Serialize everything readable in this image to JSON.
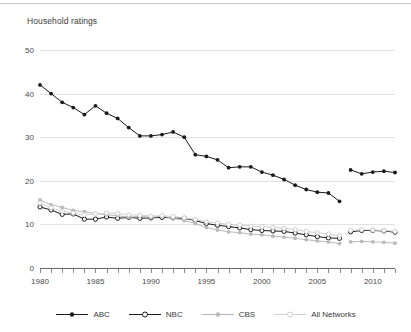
{
  "header": {
    "title": "Household ratings"
  },
  "chart_data": {
    "type": "line",
    "title": "Household ratings",
    "xlabel": "",
    "ylabel": "",
    "ylim": [
      0,
      50
    ],
    "xlim": [
      1980,
      2012
    ],
    "grid": true,
    "legend_position": "bottom",
    "y_ticks": [
      0,
      10,
      20,
      30,
      40,
      50
    ],
    "x_ticks": [
      1980,
      1985,
      1990,
      1995,
      2000,
      2005,
      2010
    ],
    "x_tick_labels": [
      "1980",
      "1985",
      "1990",
      "1995",
      "2000",
      "2005",
      "2010"
    ],
    "y_tick_labels": [
      "0",
      "10",
      "20",
      "30",
      "40",
      "50"
    ],
    "x": [
      1980,
      1981,
      1982,
      1983,
      1984,
      1985,
      1986,
      1987,
      1988,
      1989,
      1990,
      1991,
      1992,
      1993,
      1994,
      1995,
      1996,
      1997,
      1998,
      1999,
      2000,
      2001,
      2002,
      2003,
      2004,
      2005,
      2006,
      2007,
      2008,
      2009,
      2010,
      2011,
      2012
    ],
    "break_after_x": 2007,
    "series": [
      {
        "name": "ABC",
        "color": "#1a1a1a",
        "marker": "filled-circle",
        "values": [
          42.0,
          40.0,
          38.0,
          36.8,
          35.2,
          37.2,
          35.5,
          34.3,
          32.2,
          30.3,
          30.3,
          30.6,
          31.2,
          30.0,
          26.0,
          25.6,
          24.8,
          23.0,
          23.2,
          23.2,
          22.0,
          21.3,
          20.3,
          19.0,
          18.0,
          17.4,
          17.2,
          15.3,
          22.5,
          21.6,
          22.0,
          22.2,
          21.9
        ]
      },
      {
        "name": "NBC",
        "color": "#1a1a1a",
        "marker": "open-circle",
        "values": [
          14.0,
          13.3,
          12.3,
          12.4,
          11.2,
          11.2,
          11.7,
          11.4,
          11.6,
          11.4,
          11.5,
          11.6,
          11.5,
          11.4,
          10.9,
          10.2,
          9.8,
          9.5,
          9.2,
          8.8,
          8.6,
          8.5,
          8.4,
          8.0,
          7.6,
          7.2,
          6.9,
          6.8,
          8.3,
          8.6,
          8.6,
          8.5,
          8.2
        ]
      },
      {
        "name": "CBS",
        "color": "#b9b9b9",
        "marker": "filled-circle",
        "values": [
          15.6,
          14.5,
          13.9,
          13.2,
          12.9,
          12.5,
          12.2,
          12.0,
          11.6,
          11.9,
          11.6,
          11.9,
          11.4,
          10.9,
          10.2,
          9.3,
          8.7,
          8.3,
          8.1,
          7.8,
          7.6,
          7.3,
          7.1,
          6.8,
          6.5,
          6.2,
          6.0,
          5.6,
          6.0,
          6.1,
          6.0,
          5.9,
          5.7
        ]
      },
      {
        "name": "All Networks",
        "color": "#cfcfcf",
        "marker": "open-circle",
        "values": [
          14.9,
          13.8,
          13.0,
          12.6,
          12.2,
          12.4,
          12.6,
          12.5,
          12.2,
          12.1,
          11.9,
          12.0,
          11.8,
          11.5,
          11.1,
          10.6,
          10.3,
          10.0,
          9.8,
          9.6,
          9.5,
          9.3,
          9.1,
          8.8,
          8.4,
          8.1,
          7.8,
          7.4,
          8.6,
          8.8,
          8.7,
          8.6,
          8.4
        ]
      }
    ]
  },
  "legend": {
    "items": [
      {
        "label": "ABC",
        "color": "#1a1a1a",
        "marker": "filled-circle"
      },
      {
        "label": "NBC",
        "color": "#1a1a1a",
        "marker": "open-circle"
      },
      {
        "label": "CBS",
        "color": "#b9b9b9",
        "marker": "filled-circle"
      },
      {
        "label": "All Networks",
        "color": "#cfcfcf",
        "marker": "open-circle"
      }
    ]
  }
}
